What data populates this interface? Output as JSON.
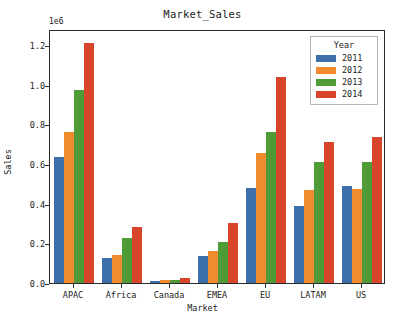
{
  "chart_data": {
    "type": "bar",
    "title": "Market_Sales",
    "xlabel": "Market",
    "ylabel": "Sales",
    "offset_text": "1e6",
    "categories": [
      "APAC",
      "Africa",
      "Canada",
      "EMEA",
      "EU",
      "LATAM",
      "US"
    ],
    "ytick_labels": [
      "0.0",
      "0.2",
      "0.4",
      "0.6",
      "0.8",
      "1.0",
      "1.2"
    ],
    "ytick_values": [
      0.0,
      0.2,
      0.4,
      0.6,
      0.8,
      1.0,
      1.2
    ],
    "ylim": [
      0.0,
      1.28
    ],
    "grid": false,
    "legend_position": "upper right",
    "legend_title": "Year",
    "series": [
      {
        "name": "2011",
        "color": "#3d6fa8",
        "values": [
          0.635,
          0.125,
          0.009,
          0.135,
          0.48,
          0.387,
          0.488
        ]
      },
      {
        "name": "2012",
        "color": "#f08c2e",
        "values": [
          0.76,
          0.142,
          0.014,
          0.163,
          0.655,
          0.468,
          0.474
        ]
      },
      {
        "name": "2013",
        "color": "#4f9b38",
        "values": [
          0.972,
          0.225,
          0.017,
          0.207,
          0.762,
          0.61,
          0.611
        ]
      },
      {
        "name": "2014",
        "color": "#d6452c",
        "values": [
          1.208,
          0.282,
          0.024,
          0.301,
          1.04,
          0.71,
          0.735
        ]
      }
    ]
  }
}
